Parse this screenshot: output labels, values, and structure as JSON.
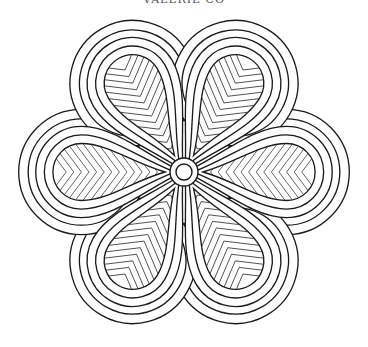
{
  "caption": "VALERIE CO",
  "artwork": {
    "type": "mandala-coloring-page",
    "petal_count": 6,
    "petal_angles_deg": [
      0,
      60,
      120,
      180,
      240,
      300
    ],
    "center": [
      184,
      172
    ],
    "stroke_color": "#1a1a1a",
    "fill_color": "#ffffff",
    "pattern": "chevron-hatching"
  }
}
